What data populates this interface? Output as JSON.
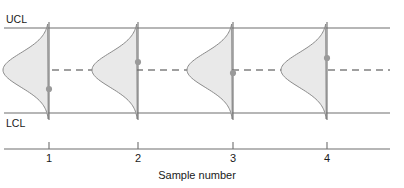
{
  "chart_data": {
    "type": "line",
    "title": "",
    "subtitle": "",
    "xlabel": "Sample number",
    "ylabel": "",
    "categories": [
      "1",
      "2",
      "3",
      "4"
    ],
    "x": [
      1,
      2,
      3,
      4
    ],
    "series": [
      {
        "name": "Sample statistic",
        "values": [
          -0.45,
          0.19,
          -0.07,
          0.28
        ]
      }
    ],
    "control_limits": {
      "upper_label": "UCL",
      "center_label": "",
      "lower_label": "LCL",
      "upper_value": 1.0,
      "center_value": 0.0,
      "lower_value": -1.0
    },
    "distributions": [
      {
        "sample": "1",
        "mean": 0.0,
        "shape": "normal"
      },
      {
        "sample": "2",
        "mean": 0.0,
        "shape": "normal"
      },
      {
        "sample": "3",
        "mean": 0.0,
        "shape": "normal"
      },
      {
        "sample": "4",
        "mean": 0.0,
        "shape": "normal"
      }
    ],
    "grid": false,
    "legend": "none",
    "ylim": [
      -1.35,
      1.35
    ],
    "xlim": [
      0.45,
      4.75
    ]
  },
  "labels": {
    "ucl": "UCL",
    "lcl": "LCL",
    "x_axis_title": "Sample number",
    "ticks": [
      "1",
      "2",
      "3",
      "4"
    ]
  },
  "colors": {
    "line": "#6e6e6e",
    "curve_stroke": "#8a8a8a",
    "curve_fill": "#e9e9e9",
    "point": "#9a9a9a",
    "text": "#1a1a1a",
    "background": "#ffffff"
  },
  "geometry": {
    "ucl_y": 28,
    "center_y": 70,
    "lcl_y": 113,
    "axis_y": 149,
    "line_start_x": 4,
    "line_end_x": 390,
    "sample_x": [
      49,
      138,
      233,
      327
    ],
    "point_y": [
      89,
      62,
      73,
      58
    ],
    "curve_top_y": 24,
    "curve_bottom_y": 119,
    "curve_width": 46
  }
}
